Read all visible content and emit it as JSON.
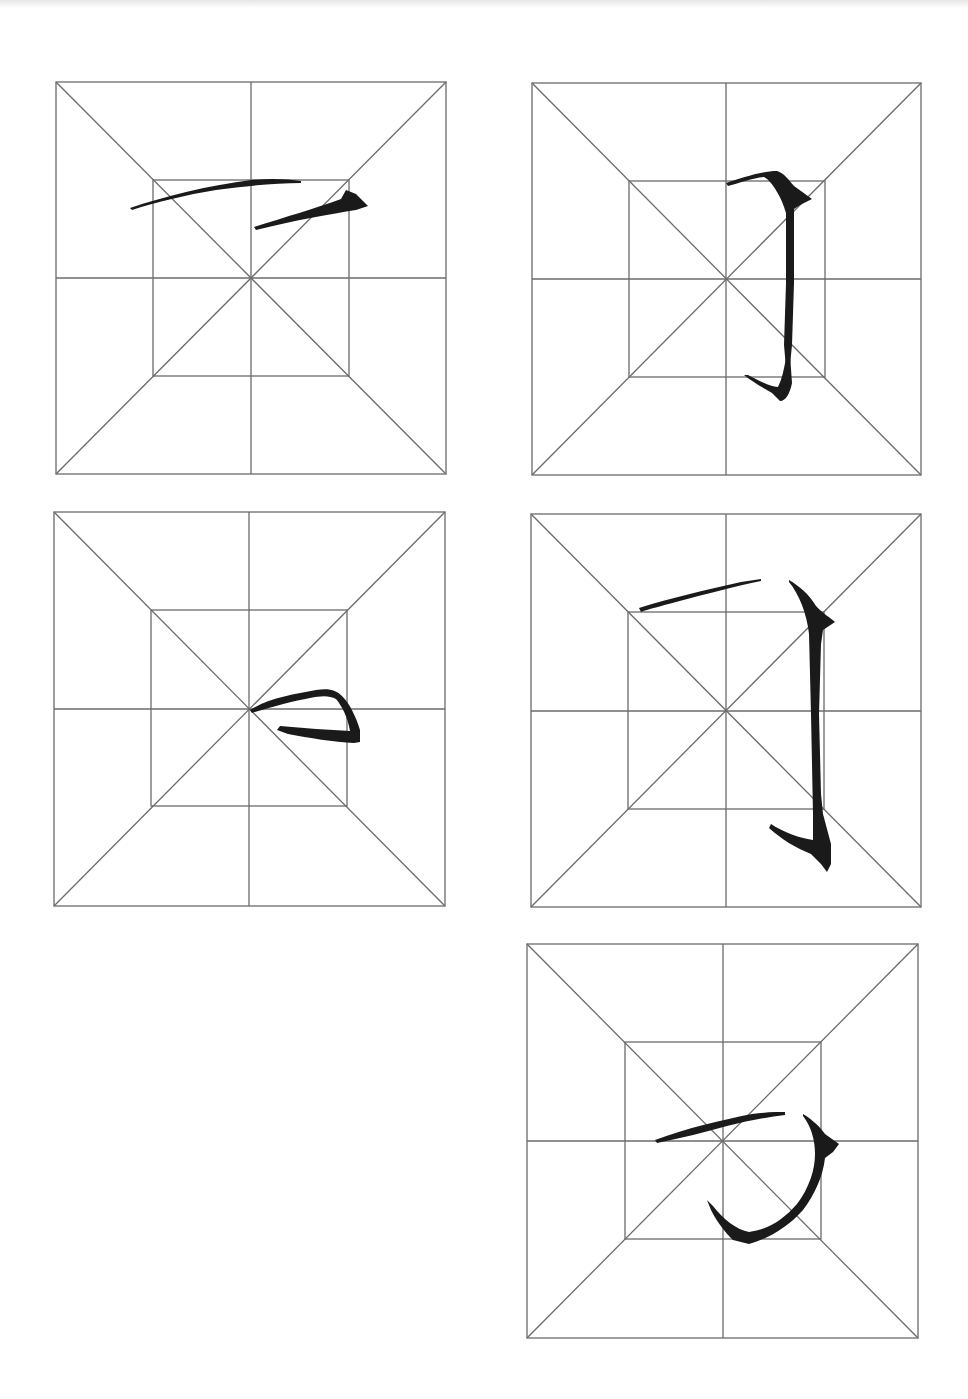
{
  "page": {
    "type": "calligraphy-practice-sheet",
    "grid_style": "mi-zi-ge (米字格) with inner square",
    "line_color": "#6b6b6b",
    "ink_color": "#1a1a1a",
    "background": "#ffffff"
  },
  "grids": [
    {
      "id": 1,
      "position": "row1-left",
      "box": [
        56,
        82,
        390,
        392
      ],
      "stroke": "heng-zhe (horizontal-turn) start: long horizontal with separate hook"
    },
    {
      "id": 2,
      "position": "row1-right",
      "box": [
        532,
        83,
        389,
        392
      ],
      "stroke": "heng-zhe-gou (horizontal-turn-hook), narrow"
    },
    {
      "id": 3,
      "position": "row2-left",
      "box": [
        54,
        512,
        391,
        394
      ],
      "stroke": "heng-zhe turn detail"
    },
    {
      "id": 4,
      "position": "row2-right",
      "box": [
        531,
        514,
        390,
        393
      ],
      "stroke": "heng-zhe-gou (horizontal-turn-hook), bold"
    },
    {
      "id": 5,
      "position": "row3-right",
      "box": [
        527,
        944,
        391,
        394
      ],
      "stroke": "heng-zhe-wan-gou (curved turn-hook)"
    }
  ]
}
